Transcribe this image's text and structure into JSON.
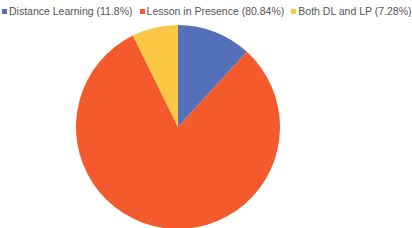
{
  "chart_data": {
    "type": "pie",
    "title": "",
    "legend_position": "top",
    "categories": [
      "Distance Learning",
      "Lesson in Presence",
      "Both DL and LP"
    ],
    "values": [
      11.8,
      80.84,
      7.28
    ],
    "labels": [
      "Distance Learning (11.8%)",
      "Lesson in Presence (80.84%)",
      "Both DL and LP (7.28%)"
    ],
    "colors": [
      "#5470B8",
      "#F55A2C",
      "#FBC843"
    ],
    "start_angle_deg": 0,
    "direction": "clockwise"
  },
  "legend": {
    "items": [
      {
        "label": "Distance Learning (11.8%)",
        "color": "#5470B8"
      },
      {
        "label": "Lesson in Presence (80.84%)",
        "color": "#F55A2C"
      },
      {
        "label": "Both DL and LP (7.28%)",
        "color": "#FBC843"
      }
    ]
  }
}
